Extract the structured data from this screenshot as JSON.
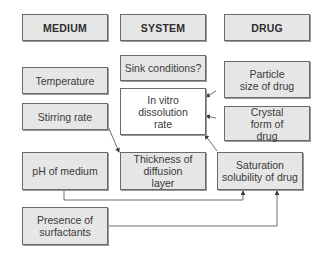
{
  "headers": {
    "medium": "MEDIUM",
    "system": "SYSTEM",
    "drug": "DRUG"
  },
  "medium": {
    "temperature": "Temperature",
    "stirring_rate": "Stirring rate",
    "ph": "pH of medium",
    "surfactants": "Presence of surfactants"
  },
  "system": {
    "sink": "Sink conditions?",
    "dissolution": "In vitro dissolution rate",
    "thickness": "Thickness of diffusion layer"
  },
  "drug": {
    "particle_size": "Particle size of drug",
    "crystal_form": "Crystal form of drug",
    "saturation": "Saturation solubility of drug"
  },
  "colors": {
    "box_fill": "#e6e6e6",
    "center_fill": "#ffffff",
    "line": "#4a4a4a"
  }
}
